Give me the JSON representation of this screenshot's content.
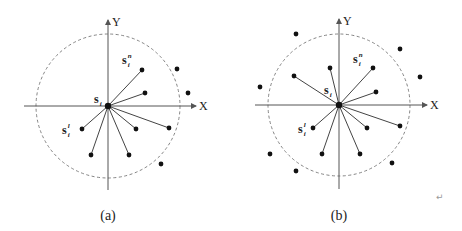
{
  "panels": [
    {
      "id": "a",
      "caption": "(a)",
      "center": [
        108,
        106
      ],
      "radius": 72,
      "axis_labels": {
        "x": "X",
        "y": "Y"
      },
      "center_label": "s_i",
      "points_connected": [
        [
          142,
          70
        ],
        [
          145,
          93
        ],
        [
          169,
          128
        ],
        [
          136,
          129
        ],
        [
          129,
          155
        ],
        [
          91,
          155
        ],
        [
          82,
          129
        ]
      ],
      "points_unconnected": [
        [
          177,
          69
        ],
        [
          188,
          93
        ],
        [
          161,
          164
        ]
      ],
      "labels": [
        {
          "text": "s",
          "sub": "i",
          "sup": "n",
          "x": 122,
          "y": 64
        },
        {
          "text": "s",
          "sub": "i",
          "sup": "l",
          "x": 62,
          "y": 134
        },
        {
          "text": "s",
          "sub": "i",
          "sup": "",
          "x": 94,
          "y": 103
        }
      ]
    },
    {
      "id": "b",
      "caption": "(b)",
      "center": [
        339,
        105
      ],
      "radius": 71,
      "axis_labels": {
        "x": "X",
        "y": "Y"
      },
      "center_label": "s_i",
      "points_connected": [
        [
          373,
          68
        ],
        [
          330,
          68
        ],
        [
          294,
          76
        ],
        [
          376,
          92
        ],
        [
          313,
          128
        ],
        [
          367,
          128
        ],
        [
          400,
          126
        ],
        [
          322,
          154
        ],
        [
          360,
          154
        ]
      ],
      "points_unconnected": [
        [
          296,
          34
        ],
        [
          400,
          49
        ],
        [
          420,
          77
        ],
        [
          260,
          87
        ],
        [
          270,
          154
        ],
        [
          392,
          163
        ],
        [
          296,
          171
        ]
      ],
      "labels": [
        {
          "text": "s",
          "sub": "i",
          "sup": "n",
          "x": 353,
          "y": 63
        },
        {
          "text": "s",
          "sub": "i",
          "sup": "l",
          "x": 298,
          "y": 133
        },
        {
          "text": "s",
          "sub": "i",
          "sup": "",
          "x": 324,
          "y": 94
        }
      ]
    }
  ],
  "return_mark": "↵"
}
